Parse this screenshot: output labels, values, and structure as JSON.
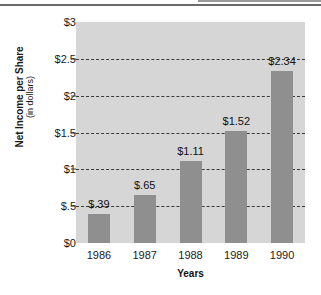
{
  "chart_data": {
    "type": "bar",
    "title": "",
    "xlabel": "Years",
    "ylabel": "Net Income per Share",
    "ylabel_sub": "(in dollars)",
    "categories": [
      "1986",
      "1987",
      "1988",
      "1989",
      "1990"
    ],
    "values": [
      0.39,
      0.65,
      1.11,
      1.52,
      2.34
    ],
    "value_labels": [
      "$.39",
      "$.65",
      "$1.11",
      "$1.52",
      "$2.34"
    ],
    "ylim": [
      0,
      3
    ],
    "ytick_values": [
      3,
      2.5,
      2,
      1.5,
      1,
      0.5,
      0
    ],
    "ytick_labels": [
      "$3",
      "$2.5",
      "$2",
      "$1.5",
      "$1",
      "$.5",
      "$0"
    ],
    "gridlines": [
      2.5,
      2,
      1.5,
      1,
      0.5
    ],
    "grid": true,
    "grid_style": "dashed",
    "legend": null,
    "bar_color": "#8f8f8f",
    "plot_background": "#d6d6d6",
    "page_background": "#ffffff",
    "grid_color": "#3a3a3a",
    "text_color": "#1a1a1a"
  },
  "axis": {
    "y_ticks": [
      {
        "label": "$3",
        "value": 3
      },
      {
        "label": "$2.5",
        "value": 2.5
      },
      {
        "label": "$2",
        "value": 2
      },
      {
        "label": "$1.5",
        "value": 1.5
      },
      {
        "label": "$1",
        "value": 1
      },
      {
        "label": "$.5",
        "value": 0.5
      },
      {
        "label": "$0",
        "value": 0
      }
    ],
    "x_ticks": [
      {
        "label": "1986"
      },
      {
        "label": "1987"
      },
      {
        "label": "1988"
      },
      {
        "label": "1989"
      },
      {
        "label": "1990"
      }
    ]
  },
  "bars": [
    {
      "year": "1986",
      "value": 0.39,
      "label": "$.39"
    },
    {
      "year": "1987",
      "value": 0.65,
      "label": "$.65"
    },
    {
      "year": "1988",
      "value": 1.11,
      "label": "$1.11"
    },
    {
      "year": "1989",
      "value": 1.52,
      "label": "$1.52"
    },
    {
      "year": "1990",
      "value": 2.34,
      "label": "$2.34"
    }
  ]
}
